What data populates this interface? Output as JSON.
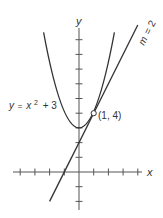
{
  "diagram": {
    "type": "function-graph",
    "axes": {
      "x_label": "x",
      "y_label": "y",
      "x_ticks": [
        -4,
        -3,
        -2,
        -1,
        1,
        2,
        3,
        4
      ],
      "y_ticks": [
        -2,
        -1,
        1,
        2,
        3,
        4,
        5,
        6,
        7,
        8,
        9
      ]
    },
    "curve": {
      "equation": "y = x^2 + 3",
      "label_y": "y",
      "label_eq": "=",
      "label_x": "x",
      "label_exp": "2",
      "label_rest": "+ 3"
    },
    "tangent_line": {
      "equation": "y = 2x + 2",
      "slope_label_m": "m",
      "slope_label_rest": "= 2"
    },
    "point": {
      "label": "(1, 4)",
      "x": 1,
      "y": 4
    },
    "colors": {
      "stroke": "#333333",
      "axis": "#555555",
      "point_fill": "#ffffff"
    }
  }
}
